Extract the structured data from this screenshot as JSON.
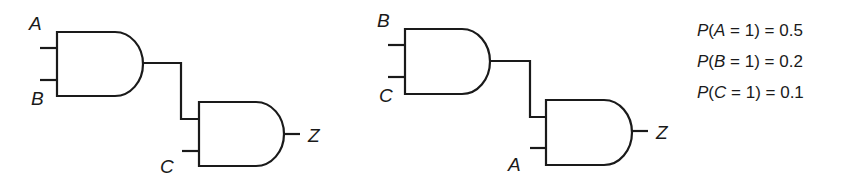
{
  "diagram": {
    "type": "logic-circuits",
    "circuits": [
      {
        "name": "left",
        "gate1": {
          "type": "AND",
          "inputs": [
            "A",
            "B"
          ]
        },
        "gate2": {
          "type": "AND",
          "inputs": [
            "gate1",
            "C"
          ]
        },
        "output": "Z",
        "labels": {
          "in1": "A",
          "in2": "B",
          "in3": "C",
          "out": "Z"
        }
      },
      {
        "name": "right",
        "gate1": {
          "type": "AND",
          "inputs": [
            "B",
            "C"
          ]
        },
        "gate2": {
          "type": "AND",
          "inputs": [
            "gate1",
            "A"
          ]
        },
        "output": "Z",
        "labels": {
          "in1": "B",
          "in2": "C",
          "in3": "A",
          "out": "Z"
        }
      }
    ],
    "probabilities": [
      {
        "var": "A",
        "value_eq": "1",
        "prob": "0.5"
      },
      {
        "var": "B",
        "value_eq": "1",
        "prob": "0.2"
      },
      {
        "var": "C",
        "value_eq": "1",
        "prob": "0.1"
      }
    ]
  }
}
